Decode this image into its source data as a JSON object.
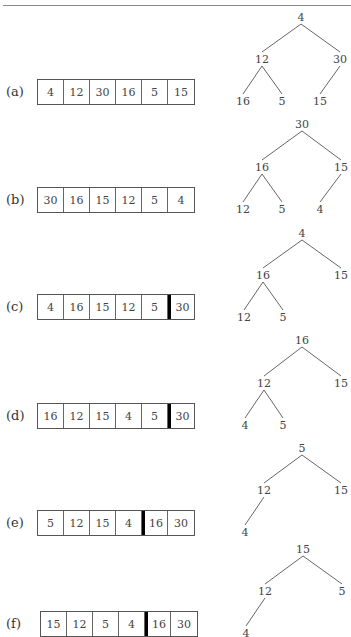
{
  "figure": {
    "steps": [
      {
        "label": "(a)",
        "array": [
          "4",
          "12",
          "30",
          "16",
          "5",
          "15"
        ],
        "sorted_from_index": null,
        "tree": {
          "root": "4",
          "nodes": [
            {
              "id": "n0",
              "value": "4",
              "x": 301,
              "y": 17
            },
            {
              "id": "n1",
              "value": "12",
              "x": 262,
              "y": 59
            },
            {
              "id": "n2",
              "value": "30",
              "x": 340,
              "y": 59
            },
            {
              "id": "n3",
              "value": "16",
              "x": 243,
              "y": 101
            },
            {
              "id": "n4",
              "value": "5",
              "x": 282,
              "y": 101
            },
            {
              "id": "n5",
              "value": "15",
              "x": 320,
              "y": 101
            }
          ],
          "edges": [
            [
              "n0",
              "n1"
            ],
            [
              "n0",
              "n2"
            ],
            [
              "n1",
              "n3"
            ],
            [
              "n1",
              "n4"
            ],
            [
              "n2",
              "n5"
            ]
          ]
        }
      },
      {
        "label": "(b)",
        "array": [
          "30",
          "16",
          "15",
          "12",
          "5",
          "4"
        ],
        "sorted_from_index": null,
        "tree": {
          "root": "30",
          "nodes": [
            {
              "id": "n0",
              "value": "30",
              "x": 302,
              "y": 124
            },
            {
              "id": "n1",
              "value": "16",
              "x": 262,
              "y": 167
            },
            {
              "id": "n2",
              "value": "15",
              "x": 341,
              "y": 167
            },
            {
              "id": "n3",
              "value": "12",
              "x": 243,
              "y": 209
            },
            {
              "id": "n4",
              "value": "5",
              "x": 282,
              "y": 209
            },
            {
              "id": "n5",
              "value": "4",
              "x": 320,
              "y": 209
            }
          ],
          "edges": [
            [
              "n0",
              "n1"
            ],
            [
              "n0",
              "n2"
            ],
            [
              "n1",
              "n3"
            ],
            [
              "n1",
              "n4"
            ],
            [
              "n2",
              "n5"
            ]
          ]
        }
      },
      {
        "label": "(c)",
        "array": [
          "4",
          "16",
          "15",
          "12",
          "5",
          "30"
        ],
        "sorted_from_index": 5,
        "tree": {
          "root": "4",
          "nodes": [
            {
              "id": "n0",
              "value": "4",
              "x": 302,
              "y": 233
            },
            {
              "id": "n1",
              "value": "16",
              "x": 263,
              "y": 275
            },
            {
              "id": "n2",
              "value": "15",
              "x": 341,
              "y": 275
            },
            {
              "id": "n3",
              "value": "12",
              "x": 244,
              "y": 317
            },
            {
              "id": "n4",
              "value": "5",
              "x": 283,
              "y": 317
            }
          ],
          "edges": [
            [
              "n0",
              "n1"
            ],
            [
              "n0",
              "n2"
            ],
            [
              "n1",
              "n3"
            ],
            [
              "n1",
              "n4"
            ]
          ]
        }
      },
      {
        "label": "(d)",
        "array": [
          "16",
          "12",
          "15",
          "4",
          "5",
          "30"
        ],
        "sorted_from_index": 5,
        "tree": {
          "root": "16",
          "nodes": [
            {
              "id": "n0",
              "value": "16",
              "x": 302,
              "y": 340
            },
            {
              "id": "n1",
              "value": "12",
              "x": 264,
              "y": 383
            },
            {
              "id": "n2",
              "value": "15",
              "x": 341,
              "y": 383
            },
            {
              "id": "n3",
              "value": "4",
              "x": 245,
              "y": 425
            },
            {
              "id": "n4",
              "value": "5",
              "x": 283,
              "y": 425
            }
          ],
          "edges": [
            [
              "n0",
              "n1"
            ],
            [
              "n0",
              "n2"
            ],
            [
              "n1",
              "n3"
            ],
            [
              "n1",
              "n4"
            ]
          ]
        }
      },
      {
        "label": "(e)",
        "array": [
          "5",
          "12",
          "15",
          "4",
          "16",
          "30"
        ],
        "sorted_from_index": 4,
        "tree": {
          "root": "5",
          "nodes": [
            {
              "id": "n0",
              "value": "5",
              "x": 302,
              "y": 448
            },
            {
              "id": "n1",
              "value": "12",
              "x": 264,
              "y": 490
            },
            {
              "id": "n2",
              "value": "15",
              "x": 341,
              "y": 490
            },
            {
              "id": "n3",
              "value": "4",
              "x": 245,
              "y": 532
            }
          ],
          "edges": [
            [
              "n0",
              "n1"
            ],
            [
              "n0",
              "n2"
            ],
            [
              "n1",
              "n3"
            ]
          ]
        }
      },
      {
        "label": "(f)",
        "array": [
          "15",
          "12",
          "5",
          "4",
          "16",
          "30"
        ],
        "sorted_from_index": 4,
        "tree": {
          "root": "15",
          "nodes": [
            {
              "id": "n0",
              "value": "15",
              "x": 303,
              "y": 549
            },
            {
              "id": "n1",
              "value": "12",
              "x": 265,
              "y": 591
            },
            {
              "id": "n2",
              "value": "5",
              "x": 342,
              "y": 591
            },
            {
              "id": "n3",
              "value": "4",
              "x": 246,
              "y": 633
            }
          ],
          "edges": [
            [
              "n0",
              "n1"
            ],
            [
              "n0",
              "n2"
            ],
            [
              "n1",
              "n3"
            ]
          ]
        }
      }
    ]
  },
  "layout": {
    "array_tops": [
      79,
      187,
      294,
      403,
      510,
      611
    ],
    "label_tops": [
      84,
      192,
      299,
      408,
      515,
      616
    ]
  }
}
